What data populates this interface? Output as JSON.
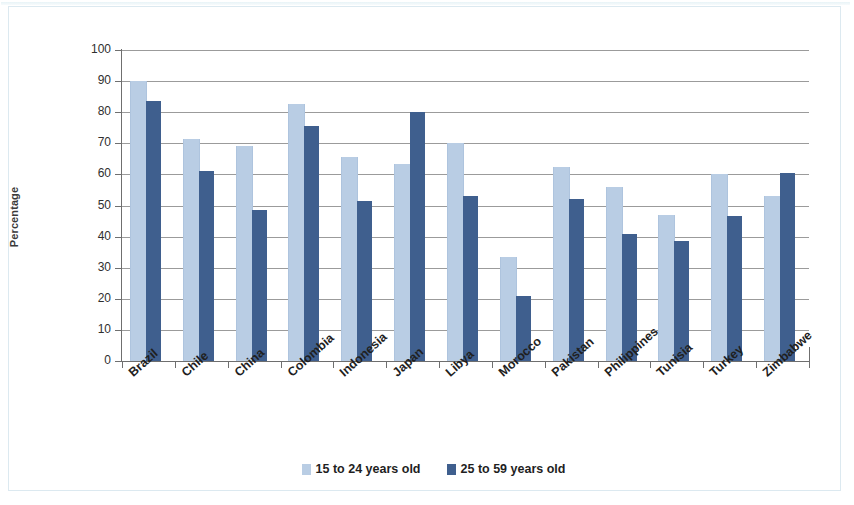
{
  "chart_data": {
    "type": "bar",
    "title": "",
    "xlabel": "",
    "ylabel": "Percentage",
    "ylim": [
      0,
      100
    ],
    "ytick_step": 10,
    "yticks": [
      100,
      90,
      80,
      70,
      60,
      50,
      40,
      30,
      20,
      10,
      0
    ],
    "grid": true,
    "legend_position": "bottom",
    "categories": [
      "Brazil",
      "Chile",
      "China",
      "Colombia",
      "Indonesia",
      "Japan",
      "Libya",
      "Morocco",
      "Pakistan",
      "Philippines",
      "Tunisia",
      "Turkey",
      "Zimbabwe"
    ],
    "series": [
      {
        "name": "15 to 24 years old",
        "color": "#b9cde4",
        "values": [
          90,
          71.5,
          69,
          82.5,
          65.5,
          63.5,
          70,
          33.5,
          62.5,
          56,
          47,
          60,
          53
        ]
      },
      {
        "name": "25 to 59 years old",
        "color": "#3f5f8e",
        "values": [
          83.5,
          61,
          48.5,
          75.5,
          51.5,
          80,
          53,
          21,
          52,
          41,
          38.5,
          46.5,
          60.5
        ]
      }
    ]
  },
  "legend": {
    "items": [
      {
        "label": "15 to 24 years old",
        "swatch": "legend-swatch-young"
      },
      {
        "label": "25 to 59 years old",
        "swatch": "legend-swatch-adult"
      }
    ]
  },
  "axes": {
    "y_title": "Percentage"
  }
}
